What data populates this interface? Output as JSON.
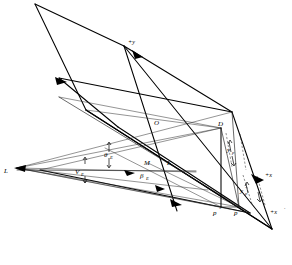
{
  "figure": {
    "type": "technical-geometry-diagram",
    "background_color": "#ffffff",
    "line_color": "#000000"
  },
  "labels": {
    "light_source": "L",
    "origin": "O",
    "point_d": "D",
    "point_m": "M",
    "point_k": "K",
    "point_p_double_prime": "p",
    "point_p_prime": "p",
    "prime_mark_double": "″",
    "prime_mark_single": "′",
    "axis_plus_y": "+y",
    "axis_plus_x": "+x",
    "axis_plus_x_prime": "+x",
    "vector_ve": "V",
    "vector_ve_sub": "E",
    "angle_theta_e": "θ",
    "angle_theta_e_sub": "E",
    "angle_beta_e": "β",
    "angle_beta_e_sub": "E",
    "dim_yp": "y",
    "dim_yp_sub": "p",
    "dim_yp_prime": "y",
    "dim_yp_prime_sub": "p"
  },
  "geometry": {
    "upper_plane": {
      "name": "upper-parallelogram",
      "vertices": [
        [
          35,
          4
        ],
        [
          124,
          46
        ],
        [
          272,
          229
        ],
        [
          155,
          119
        ]
      ]
    },
    "lower_plane": {
      "name": "lower-parallelogram",
      "vertices": [
        [
          59,
          97
        ],
        [
          117,
          126
        ],
        [
          250,
          213
        ],
        [
          148,
          171
        ]
      ]
    },
    "axis_y_line": {
      "from": [
        124,
        46
      ],
      "to": [
        175,
        209
      ]
    },
    "axis_x_line": {
      "from": [
        155,
        119
      ],
      "to": [
        272,
        229
      ]
    },
    "light_rays_count": 6,
    "vertical_drop": {
      "from": [
        221,
        128
      ],
      "to": [
        221,
        207
      ]
    }
  },
  "colors": {
    "ink": "#000000",
    "ink_thin": "#1a1a1a",
    "paper": "#ffffff"
  }
}
